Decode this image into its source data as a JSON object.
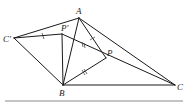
{
  "figure": {
    "type": "geometry-diagram",
    "points": {
      "A": {
        "label": "A",
        "x": 79,
        "y": 18
      },
      "P1": {
        "label": "P′",
        "x": 62,
        "y": 34
      },
      "C1": {
        "label": "C′",
        "x": 14,
        "y": 38
      },
      "P": {
        "label": "P",
        "x": 106,
        "y": 58
      },
      "B": {
        "label": "B",
        "x": 63,
        "y": 85
      },
      "C": {
        "label": "C",
        "x": 175,
        "y": 85
      }
    },
    "segments": [
      [
        "C1",
        "A"
      ],
      [
        "C1",
        "P1"
      ],
      [
        "C1",
        "B"
      ],
      [
        "A",
        "B"
      ],
      [
        "A",
        "P"
      ],
      [
        "A",
        "C"
      ],
      [
        "P1",
        "B"
      ],
      [
        "P1",
        "C"
      ],
      [
        "B",
        "P"
      ],
      [
        "B",
        "C"
      ]
    ],
    "tick_marks": [
      {
        "segment": "C'P'",
        "count": 1
      },
      {
        "segment": "AP",
        "count": 1
      },
      {
        "segment": "P'P",
        "count": 2
      },
      {
        "segment": "BP",
        "count": 2
      }
    ],
    "labels": {
      "A": "A",
      "P_prime": "P′",
      "C_prime": "C′",
      "P": "P",
      "B": "B",
      "C": "C"
    }
  }
}
